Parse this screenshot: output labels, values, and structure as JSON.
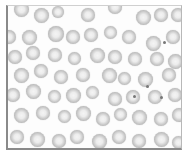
{
  "image": {
    "subject": "blood smear micrograph of red blood cells",
    "frame_color": "#8a8a8a",
    "background_color": "#ffffff",
    "cell_color": "#b0b0b0"
  },
  "cells": [
    {
      "x": 6,
      "y": -4,
      "d": 15
    },
    {
      "x": 26,
      "y": 2,
      "d": 15
    },
    {
      "x": 44,
      "y": 0,
      "d": 12
    },
    {
      "x": 73,
      "y": 2,
      "d": 14
    },
    {
      "x": 100,
      "y": -6,
      "d": 14
    },
    {
      "x": 128,
      "y": 4,
      "d": 15
    },
    {
      "x": 146,
      "y": 2,
      "d": 14
    },
    {
      "x": 163,
      "y": 2,
      "d": 14
    },
    {
      "x": -6,
      "y": 24,
      "d": 14
    },
    {
      "x": 14,
      "y": 24,
      "d": 15
    },
    {
      "x": 40,
      "y": 20,
      "d": 16
    },
    {
      "x": 58,
      "y": 24,
      "d": 14
    },
    {
      "x": 76,
      "y": 22,
      "d": 14
    },
    {
      "x": 96,
      "y": 20,
      "d": 13
    },
    {
      "x": 114,
      "y": 24,
      "d": 14
    },
    {
      "x": 138,
      "y": 30,
      "d": 15
    },
    {
      "x": 158,
      "y": 24,
      "d": 14
    },
    {
      "x": 0,
      "y": 44,
      "d": 14
    },
    {
      "x": 18,
      "y": 40,
      "d": 14
    },
    {
      "x": 40,
      "y": 42,
      "d": 14
    },
    {
      "x": 60,
      "y": 46,
      "d": 13
    },
    {
      "x": 82,
      "y": 42,
      "d": 15
    },
    {
      "x": 100,
      "y": 44,
      "d": 14
    },
    {
      "x": 120,
      "y": 46,
      "d": 14
    },
    {
      "x": 142,
      "y": 46,
      "d": 14
    },
    {
      "x": 160,
      "y": 48,
      "d": 15
    },
    {
      "x": 6,
      "y": 62,
      "d": 15
    },
    {
      "x": 26,
      "y": 58,
      "d": 14
    },
    {
      "x": 46,
      "y": 64,
      "d": 14
    },
    {
      "x": 68,
      "y": 62,
      "d": 14
    },
    {
      "x": 94,
      "y": 62,
      "d": 15
    },
    {
      "x": 110,
      "y": 66,
      "d": 13
    },
    {
      "x": 130,
      "y": 66,
      "d": 15
    },
    {
      "x": 154,
      "y": 62,
      "d": 14
    },
    {
      "x": -2,
      "y": 82,
      "d": 14
    },
    {
      "x": 18,
      "y": 78,
      "d": 15
    },
    {
      "x": 40,
      "y": 84,
      "d": 13
    },
    {
      "x": 58,
      "y": 82,
      "d": 15
    },
    {
      "x": 78,
      "y": 80,
      "d": 13
    },
    {
      "x": 100,
      "y": 86,
      "d": 14
    },
    {
      "x": 118,
      "y": 84,
      "d": 14
    },
    {
      "x": 140,
      "y": 84,
      "d": 14
    },
    {
      "x": 160,
      "y": 82,
      "d": 14
    },
    {
      "x": 6,
      "y": 102,
      "d": 15
    },
    {
      "x": 28,
      "y": 100,
      "d": 14
    },
    {
      "x": 50,
      "y": 104,
      "d": 13
    },
    {
      "x": 68,
      "y": 100,
      "d": 15
    },
    {
      "x": 88,
      "y": 106,
      "d": 14
    },
    {
      "x": 106,
      "y": 102,
      "d": 13
    },
    {
      "x": 124,
      "y": 104,
      "d": 15
    },
    {
      "x": 146,
      "y": 106,
      "d": 14
    },
    {
      "x": 164,
      "y": 102,
      "d": 14
    },
    {
      "x": 2,
      "y": 124,
      "d": 14
    },
    {
      "x": 22,
      "y": 126,
      "d": 15
    },
    {
      "x": 44,
      "y": 128,
      "d": 14
    },
    {
      "x": 62,
      "y": 124,
      "d": 14
    },
    {
      "x": 84,
      "y": 128,
      "d": 15
    },
    {
      "x": 104,
      "y": 124,
      "d": 14
    },
    {
      "x": 124,
      "y": 128,
      "d": 14
    },
    {
      "x": 146,
      "y": 126,
      "d": 15
    },
    {
      "x": 164,
      "y": 130,
      "d": 13
    }
  ],
  "dots": [
    {
      "x": 125,
      "y": 89
    },
    {
      "x": 138,
      "y": 79
    },
    {
      "x": 152,
      "y": 90
    },
    {
      "x": 155,
      "y": 35
    }
  ]
}
